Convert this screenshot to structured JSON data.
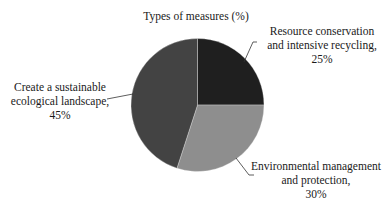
{
  "chart_data": {
    "type": "pie",
    "title": "Types of measures (%)",
    "categories": [
      "Resource conservation and intensive recycling",
      "Environmental management and protection",
      "Create a sustainable ecological landscape"
    ],
    "values": [
      25,
      30,
      45
    ],
    "unit": "%",
    "start_angle": "12 o'clock",
    "direction": "clockwise",
    "colors": [
      "#1f1f1f",
      "#8e8e8e",
      "#434343"
    ],
    "legend": "none (data labels with leader lines)",
    "labels": [
      {
        "line1": "Resource conservation",
        "line2": "and intensive recycling,",
        "line3": "25%"
      },
      {
        "line1": "Environmental management",
        "line2": "and protection,",
        "line3": "30%"
      },
      {
        "line1": "Create a sustainable",
        "line2": "ecological landscape,",
        "line3": "45%"
      }
    ]
  }
}
